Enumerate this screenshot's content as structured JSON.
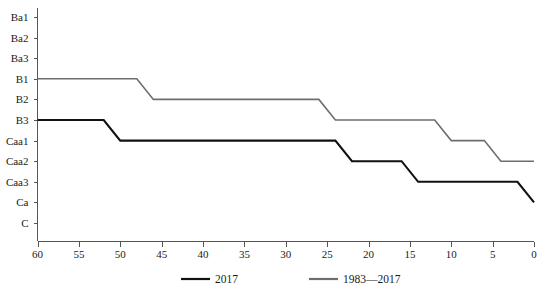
{
  "chart_data": {
    "type": "line",
    "title": "",
    "subtitle": "",
    "xlabel": "",
    "ylabel": "",
    "grid": false,
    "legend_position": "bottom",
    "x_axis": {
      "ticks": [
        60,
        55,
        50,
        45,
        40,
        35,
        30,
        25,
        20,
        15,
        10,
        5,
        0
      ],
      "tick_labels": [
        "60",
        "55",
        "50",
        "45",
        "40",
        "35",
        "30",
        "25",
        "20",
        "15",
        "10",
        "5",
        "0"
      ],
      "min": 60,
      "max": 0,
      "reversed": true
    },
    "y_axis": {
      "categories": [
        "Ba1",
        "Ba2",
        "Ba3",
        "B1",
        "B2",
        "B3",
        "Caa1",
        "Caa2",
        "Caa3",
        "Ca",
        "C"
      ],
      "tick_labels": [
        "Ba1",
        "Ba2",
        "Ba3",
        "B1",
        "B2",
        "B3",
        "Caa1",
        "Caa2",
        "Caa3",
        "Ca",
        "C"
      ]
    },
    "series": [
      {
        "name": "2017",
        "color": "#111111",
        "points": [
          {
            "x": 60,
            "y": "B3"
          },
          {
            "x": 52,
            "y": "B3"
          },
          {
            "x": 50,
            "y": "Caa1"
          },
          {
            "x": 24,
            "y": "Caa1"
          },
          {
            "x": 22,
            "y": "Caa2"
          },
          {
            "x": 16,
            "y": "Caa2"
          },
          {
            "x": 14,
            "y": "Caa3"
          },
          {
            "x": 2,
            "y": "Caa3"
          },
          {
            "x": 0,
            "y": "Ca"
          }
        ]
      },
      {
        "name": "1983—2017",
        "color": "#6e6e6e",
        "points": [
          {
            "x": 60,
            "y": "B1"
          },
          {
            "x": 48,
            "y": "B1"
          },
          {
            "x": 46,
            "y": "B2"
          },
          {
            "x": 26,
            "y": "B2"
          },
          {
            "x": 24,
            "y": "B3"
          },
          {
            "x": 12,
            "y": "B3"
          },
          {
            "x": 10,
            "y": "Caa1"
          },
          {
            "x": 6,
            "y": "Caa1"
          },
          {
            "x": 4,
            "y": "Caa2"
          },
          {
            "x": 0,
            "y": "Caa2"
          }
        ]
      }
    ]
  },
  "legend": {
    "items": [
      {
        "label": "2017",
        "color": "#111111"
      },
      {
        "label": "1983—2017",
        "color": "#6e6e6e"
      }
    ]
  },
  "colors": {
    "series_2017": "#111111",
    "series_1983_2017": "#6e6e6e",
    "axis": "#555555",
    "text": "#1a1a1a",
    "background": "#ffffff"
  }
}
